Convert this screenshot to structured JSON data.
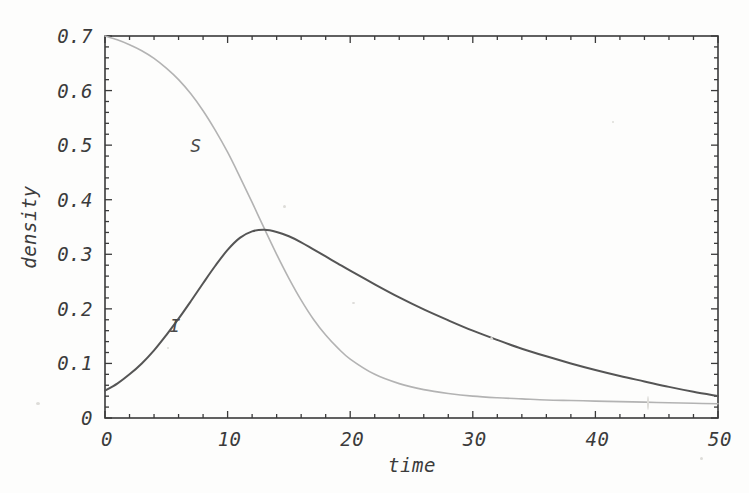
{
  "chart_data": {
    "type": "line",
    "title": "",
    "xlabel": "time",
    "ylabel": "density",
    "xlim": [
      0,
      50
    ],
    "ylim": [
      0,
      0.7
    ],
    "grid": false,
    "legend_position": "inline-annotations",
    "frame": true,
    "xticks": [
      "0",
      "10",
      "20",
      "30",
      "40",
      "50"
    ],
    "xtick_values": [
      0,
      10,
      20,
      30,
      40,
      50
    ],
    "yticks": [
      "0",
      "0.1",
      "0.2",
      "0.3",
      "0.4",
      "0.5",
      "0.6",
      "0.7"
    ],
    "ytick_values": [
      0,
      0.1,
      0.2,
      0.3,
      0.4,
      0.5,
      0.6,
      0.7
    ],
    "x": [
      0,
      1,
      2,
      3,
      4,
      5,
      6,
      7,
      8,
      9,
      10,
      11,
      12,
      13,
      14,
      15,
      16,
      17,
      18,
      19,
      20,
      22,
      24,
      26,
      28,
      30,
      32,
      34,
      36,
      38,
      40,
      42,
      44,
      46,
      48,
      50
    ],
    "series": [
      {
        "name": "S",
        "label": "S",
        "color": "#b3b3b3",
        "linewidth": 1.6,
        "annotation": {
          "text": "S",
          "x": 7.4,
          "y": 0.487
        },
        "values": [
          0.7,
          0.693,
          0.684,
          0.673,
          0.659,
          0.641,
          0.62,
          0.594,
          0.563,
          0.527,
          0.487,
          0.442,
          0.395,
          0.347,
          0.3,
          0.256,
          0.216,
          0.181,
          0.152,
          0.128,
          0.108,
          0.08,
          0.063,
          0.052,
          0.045,
          0.04,
          0.037,
          0.035,
          0.033,
          0.032,
          0.031,
          0.03,
          0.029,
          0.028,
          0.027,
          0.026
        ]
      },
      {
        "name": "I",
        "label": "I",
        "color": "#555555",
        "linewidth": 2.0,
        "annotation": {
          "text": "I",
          "x": 5.7,
          "y": 0.157
        },
        "values": [
          0.05,
          0.063,
          0.08,
          0.1,
          0.124,
          0.152,
          0.182,
          0.214,
          0.247,
          0.279,
          0.308,
          0.33,
          0.342,
          0.345,
          0.341,
          0.333,
          0.322,
          0.309,
          0.296,
          0.283,
          0.27,
          0.245,
          0.221,
          0.199,
          0.179,
          0.16,
          0.143,
          0.127,
          0.113,
          0.1,
          0.088,
          0.077,
          0.067,
          0.057,
          0.048,
          0.04
        ]
      }
    ],
    "peak_annotation": {
      "series": "I",
      "x": 13,
      "y": 0.345
    },
    "crossing_annotation": {
      "x": 8.6,
      "y": 0.27
    }
  },
  "plot_geometry": {
    "frame_left": 105,
    "frame_top": 36,
    "frame_right": 718,
    "frame_bottom": 418,
    "axis_color": "#3a3a3a",
    "frame_color": "#3a3a3a",
    "background": "#fdfdfc"
  }
}
